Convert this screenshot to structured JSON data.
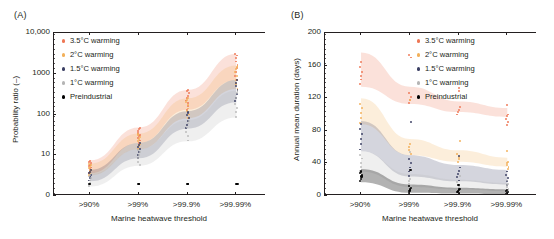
{
  "figure": {
    "panels": [
      {
        "id": "A",
        "label": "(A)",
        "ylabel": "Probability ratio (–)",
        "xlabel": "Marine heatwave threshold",
        "yticks": [
          "0",
          "10",
          "100",
          "1000",
          "10,000"
        ],
        "xticks": [
          ">90%",
          ">99%",
          ">99.9%",
          ">99.99%"
        ]
      },
      {
        "id": "B",
        "label": "(B)",
        "ylabel": "Annual mean duration (days)",
        "xlabel": "Marine heatwave threshold",
        "yticks": [
          "0",
          "40",
          "80",
          "120",
          "160",
          "200"
        ],
        "xticks": [
          ">90%",
          ">99%",
          ">99.9%",
          ">99.99%"
        ]
      }
    ],
    "legend": {
      "items": [
        {
          "label": "3.5°C warming",
          "color": "#ee7755"
        },
        {
          "label": "2°C warming",
          "color": "#f2b05a"
        },
        {
          "label": "1.5°C warming",
          "color": "#3b3f63"
        },
        {
          "label": "1°C warming",
          "color": "#b5b5b5"
        },
        {
          "label": "Preindustrial",
          "color": "#000000"
        }
      ]
    }
  },
  "chart_data": [
    {
      "type": "line",
      "panel": "A",
      "title": "(A)",
      "xlabel": "Marine heatwave threshold",
      "ylabel": "Probability ratio (–)",
      "categories": [
        ">90%",
        ">99%",
        ">99.9%",
        ">99.99%"
      ],
      "yscale": "log",
      "ylim": [
        1,
        10000
      ],
      "ytick_values": [
        1,
        10,
        100,
        1000,
        10000
      ],
      "ytick_labels": [
        "0",
        "10",
        "100",
        "1000",
        "10,000"
      ],
      "grid": false,
      "legend_position": "upper-left",
      "series": [
        {
          "name": "3.5°C warming",
          "color": "#ee7755",
          "band_low": [
            3.6,
            20,
            130,
            700
          ],
          "band_high": [
            7.5,
            48,
            400,
            3100
          ],
          "median": [
            5.2,
            30,
            220,
            1300
          ],
          "points": [
            3.7,
            4.2,
            4.6,
            5.0,
            5.4,
            5.9,
            6.4,
            7.0,
            7.4,
            20,
            23,
            26,
            29,
            32,
            36,
            40,
            44,
            47,
            130,
            160,
            190,
            220,
            250,
            290,
            330,
            370,
            395,
            720,
            900,
            1100,
            1350,
            1650,
            2000,
            2400,
            2800,
            3050
          ]
        },
        {
          "name": "2°C warming",
          "color": "#f2b05a",
          "band_low": [
            3.2,
            14,
            80,
            420
          ],
          "band_high": [
            6.2,
            34,
            250,
            1600
          ],
          "median": [
            4.3,
            21,
            140,
            800
          ],
          "points": [
            3.3,
            3.7,
            4.1,
            4.4,
            4.8,
            5.2,
            5.7,
            6.1,
            14,
            17,
            19,
            22,
            25,
            28,
            31,
            33,
            82,
            100,
            120,
            140,
            170,
            200,
            230,
            248,
            430,
            560,
            700,
            880,
            1080,
            1300,
            1500,
            1580
          ]
        },
        {
          "name": "1.5°C warming",
          "color": "#3b3f63",
          "band_low": [
            2.3,
            8.5,
            45,
            200
          ],
          "band_high": [
            4.4,
            20,
            120,
            700
          ],
          "median": [
            3.1,
            13,
            72,
            390
          ],
          "points": [
            2.4,
            2.7,
            3.0,
            3.3,
            3.6,
            3.9,
            4.3,
            8.6,
            10,
            12,
            14,
            16,
            18,
            19.5,
            46,
            56,
            68,
            80,
            95,
            110,
            118,
            210,
            260,
            320,
            400,
            500,
            600,
            690
          ]
        },
        {
          "name": "1°C warming",
          "color": "#b5b5b5",
          "band_low": [
            1.7,
            5.5,
            22,
            85
          ],
          "band_high": [
            3.4,
            14,
            72,
            380
          ],
          "median": [
            2.4,
            8.5,
            40,
            175
          ],
          "points": [
            1.8,
            2.1,
            2.4,
            2.7,
            3.0,
            3.3,
            5.8,
            7.0,
            8.5,
            10,
            12,
            13.5,
            23,
            30,
            38,
            48,
            60,
            70,
            88,
            115,
            145,
            185,
            250,
            330,
            370
          ]
        },
        {
          "name": "Preindustrial",
          "color": "#000000",
          "band_low": [
            1,
            1,
            1,
            1
          ],
          "band_high": [
            1,
            1,
            1,
            1
          ],
          "median": [
            1,
            1,
            1,
            1
          ],
          "points": [
            2.0,
            2.0,
            2.0,
            2.0
          ]
        }
      ]
    },
    {
      "type": "line",
      "panel": "B",
      "title": "(B)",
      "xlabel": "Marine heatwave threshold",
      "ylabel": "Annual mean duration (days)",
      "categories": [
        ">90%",
        ">99%",
        ">99.9%",
        ">99.99%"
      ],
      "yscale": "linear",
      "ylim": [
        0,
        200
      ],
      "ytick_values": [
        0,
        40,
        80,
        120,
        160,
        200
      ],
      "ytick_labels": [
        "0",
        "40",
        "80",
        "120",
        "160",
        "200"
      ],
      "grid": false,
      "legend_position": "upper-right",
      "series": [
        {
          "name": "3.5°C warming",
          "color": "#ee7755",
          "band_low": [
            134,
            113,
            103,
            97
          ],
          "band_high": [
            176,
            134,
            116,
            108
          ],
          "median": [
            155,
            123,
            109,
            102
          ],
          "points": [
            137,
            143,
            147,
            152,
            158,
            164,
            170,
            173,
            114,
            118,
            122,
            126,
            129,
            132,
            100,
            103,
            106,
            109,
            112,
            87,
            91,
            95,
            98,
            100
          ]
        },
        {
          "name": "2°C warming",
          "color": "#f2b05a",
          "band_low": [
            88,
            50,
            42,
            36
          ],
          "band_high": [
            120,
            70,
            56,
            47
          ],
          "median": [
            104,
            60,
            49,
            41
          ],
          "points": [
            90,
            96,
            102,
            108,
            113,
            118,
            51,
            56,
            60,
            64,
            68,
            42,
            45,
            48,
            52,
            55,
            33,
            36,
            38,
            40,
            42
          ]
        },
        {
          "name": "1.5°C warming",
          "color": "#3b3f63",
          "band_low": [
            55,
            24,
            18,
            14
          ],
          "band_high": [
            92,
            50,
            38,
            32
          ],
          "median": [
            72,
            36,
            27,
            22
          ],
          "points": [
            57,
            64,
            70,
            76,
            82,
            88,
            91,
            25,
            30,
            35,
            40,
            45,
            49,
            19,
            23,
            27,
            31,
            35,
            14,
            18,
            22,
            26,
            30
          ]
        },
        {
          "name": "1°C warming",
          "color": "#b5b5b5",
          "band_low": [
            30,
            11,
            8,
            6
          ],
          "band_high": [
            55,
            27,
            20,
            16
          ],
          "median": [
            42,
            18,
            13,
            10
          ],
          "points": [
            31,
            36,
            41,
            46,
            50,
            54,
            12,
            15,
            18,
            21,
            25,
            8,
            11,
            14,
            17,
            19,
            6,
            9,
            11,
            13,
            15
          ]
        },
        {
          "name": "Preindustrial",
          "color": "#000000",
          "band_low": [
            17,
            4,
            3,
            2
          ],
          "band_high": [
            33,
            14,
            10,
            8
          ],
          "median": [
            26,
            8,
            6,
            4
          ],
          "points": [
            18,
            21,
            24,
            26,
            28,
            30,
            32,
            4,
            6,
            8,
            10,
            12,
            13,
            3,
            5,
            6,
            8,
            9,
            2,
            3,
            5,
            6,
            7
          ]
        }
      ]
    }
  ]
}
